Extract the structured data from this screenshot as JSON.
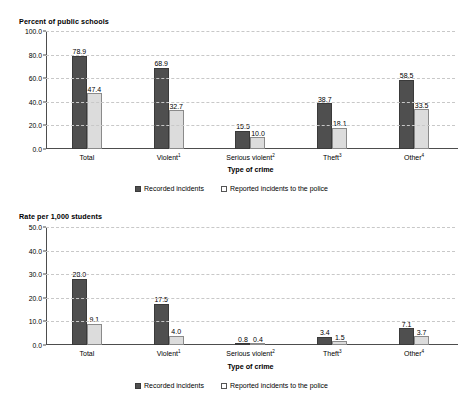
{
  "chart_data": [
    {
      "id": "percent-of-public-schools",
      "type": "bar",
      "title": "Percent of public schools",
      "ylabel": "Percent of public schools",
      "xlabel": "Type of crime",
      "ylim": [
        0,
        100
      ],
      "yticks": [
        "0.0",
        "20.0",
        "40.0",
        "60.0",
        "80.0",
        "100.0"
      ],
      "ytick_values": [
        0,
        20,
        40,
        60,
        80,
        100
      ],
      "grid": true,
      "legend_position": "bottom",
      "categories": [
        "Total",
        "Violent",
        "Serious violent",
        "Theft",
        "Other"
      ],
      "category_footnotes": [
        "",
        "1",
        "2",
        "3",
        "4"
      ],
      "series": [
        {
          "name": "Recorded incidents",
          "color": "#4f4f4f",
          "values": [
            78.9,
            68.9,
            15.5,
            38.7,
            58.5
          ],
          "labels": [
            "78.9",
            "68.9",
            "15.5",
            "38.7",
            "58.5"
          ]
        },
        {
          "name": "Reported incidents to the police",
          "color": "#dcdcdc",
          "values": [
            47.4,
            32.7,
            10.0,
            18.1,
            33.5
          ],
          "labels": [
            "47.4",
            "32.7",
            "10.0",
            "18.1",
            "33.5"
          ]
        }
      ]
    },
    {
      "id": "rate-per-1000-students",
      "type": "bar",
      "title": "Rate per 1,000 students",
      "ylabel": "Rate per 1,000 students",
      "xlabel": "Type of crime",
      "ylim": [
        0,
        50
      ],
      "yticks": [
        "0.0",
        "10.0",
        "20.0",
        "30.0",
        "40.0",
        "50.0"
      ],
      "ytick_values": [
        0,
        10,
        20,
        30,
        40,
        50
      ],
      "grid": true,
      "legend_position": "bottom",
      "categories": [
        "Total",
        "Violent",
        "Serious violent",
        "Theft",
        "Other"
      ],
      "category_footnotes": [
        "",
        "1",
        "2",
        "3",
        "4"
      ],
      "series": [
        {
          "name": "Recorded incidents",
          "color": "#4f4f4f",
          "values": [
            28.0,
            17.5,
            0.8,
            3.4,
            7.1
          ],
          "labels": [
            "28.0",
            "17.5",
            "0.8",
            "3.4",
            "7.1"
          ]
        },
        {
          "name": "Reported incidents to the police",
          "color": "#dcdcdc",
          "values": [
            9.1,
            4.0,
            0.4,
            1.5,
            3.7
          ],
          "labels": [
            "9.1",
            "4.0",
            "0.4",
            "1.5",
            "3.7"
          ]
        }
      ]
    }
  ]
}
